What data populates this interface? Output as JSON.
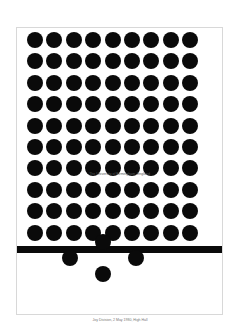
{
  "poster": {
    "text": "The University of Birmingham, England",
    "grid": {
      "rows": 10,
      "cols": 9,
      "dot_color": "#0a0a0a"
    },
    "bottom_dots": [
      {
        "name": "top",
        "x": 102,
        "y": 241
      },
      {
        "name": "left",
        "x": 69,
        "y": 257
      },
      {
        "name": "right",
        "x": 135,
        "y": 257
      },
      {
        "name": "bottom",
        "x": 102,
        "y": 273
      }
    ]
  },
  "caption": "Joy Division, 2 May 1980, High Hall"
}
